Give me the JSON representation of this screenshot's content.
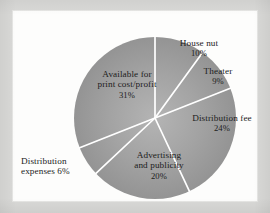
{
  "chart_data": {
    "type": "pie",
    "title": "",
    "subtitle": "",
    "xlabel": "",
    "ylabel": "",
    "grid": false,
    "legend": "none",
    "units": "percent",
    "start_angle_deg": 0,
    "direction": "clockwise",
    "total": 100,
    "categories": [
      "House nut",
      "Theater",
      "Distribution fee",
      "Advertising and publicity",
      "Distribution expenses",
      "Available for print cost/profit"
    ],
    "values": [
      10,
      9,
      24,
      20,
      6,
      31
    ],
    "slices": [
      {
        "name": "House nut",
        "label_line1": "House nut",
        "label_line2": "",
        "percent_text": "10%",
        "value": 10,
        "color": "#9b9b9b",
        "start_deg": 0,
        "end_deg": 36
      },
      {
        "name": "Theater",
        "label_line1": "Theater",
        "label_line2": "",
        "percent_text": "9%",
        "value": 9,
        "color": "#9a9a9a",
        "start_deg": 36,
        "end_deg": 68.4
      },
      {
        "name": "Distribution fee",
        "label_line1": "Distribution fee",
        "label_line2": "",
        "percent_text": "24%",
        "value": 24,
        "color": "#979797",
        "start_deg": 68.4,
        "end_deg": 154.8
      },
      {
        "name": "Advertising and publicity",
        "label_line1": "Advertising",
        "label_line2": "and publicity",
        "percent_text": "20%",
        "value": 20,
        "color": "#9c9c9c",
        "start_deg": 154.8,
        "end_deg": 226.8
      },
      {
        "name": "Distribution expenses",
        "label_line1": "Distribution",
        "label_line2": "expenses 6%",
        "percent_text": "6%",
        "value": 6,
        "color": "#a0a0a0",
        "start_deg": 226.8,
        "end_deg": 248.4
      },
      {
        "name": "Available for print cost/profit",
        "label_line1": "Available for",
        "label_line2": "print cost/profit",
        "percent_text": "31%",
        "value": 31,
        "color": "#a2a2a2",
        "start_deg": 248.4,
        "end_deg": 360
      }
    ],
    "geometry": {
      "center_x": 142,
      "center_y": 107,
      "radius": 81
    },
    "style": {
      "plate_background": "#fdfdfc",
      "page_background": "#d9d9d7",
      "separator_color": "#ffffff",
      "label_color": "#1c1c1c",
      "fill_light": "#b0b0b0",
      "fill_dark": "#8d8d8d"
    }
  }
}
